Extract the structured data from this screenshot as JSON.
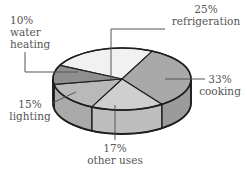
{
  "chart_data": {
    "type": "pie",
    "style": "3d-pie",
    "title": "",
    "categories": [
      "refrigeration",
      "cooking",
      "other uses",
      "lighting",
      "water heating"
    ],
    "values": [
      25,
      33,
      17,
      15,
      10
    ],
    "labels": [
      {
        "pct": "25%",
        "name": "refrigeration"
      },
      {
        "pct": "33%",
        "name": "cooking"
      },
      {
        "pct": "17%",
        "name": "other uses"
      },
      {
        "pct": "15%",
        "name": "lighting"
      },
      {
        "pct": "10%",
        "name": "water",
        "name2": "heating"
      }
    ],
    "colors": {
      "refrigeration": "#f1f1f1",
      "cooking": "#a9a9a9",
      "other_uses": "#cfcfcf",
      "lighting": "#b9b9b9",
      "water_heating": "#8f8f8f",
      "outline": "#1e1e1e",
      "leader": "#555555"
    },
    "legend": "none (callout labels)"
  }
}
